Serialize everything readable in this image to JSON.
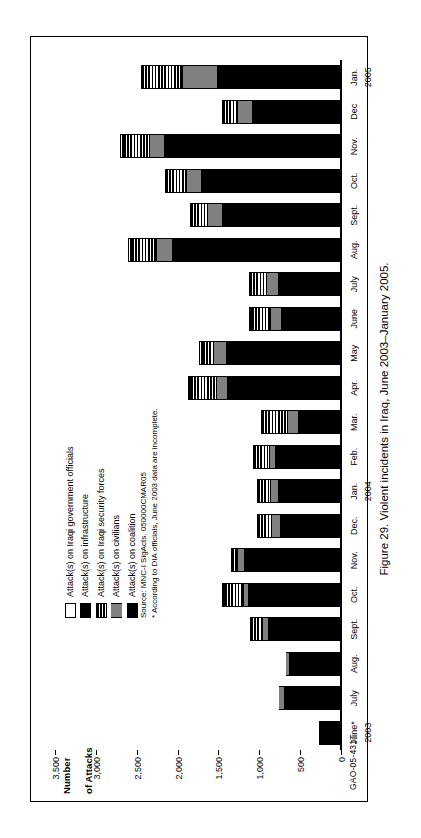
{
  "caption": "Figure 29. Violent incidents in Iraq, June 2003–January 2005.",
  "report_id": "GAO-05-431T",
  "axis": {
    "y_title_line1": "Number",
    "y_title_line2": "of Attacks"
  },
  "legend": {
    "items": [
      {
        "label": "Attack(s) on Iraqi government officials",
        "key": "gov",
        "swatch": "white-outline"
      },
      {
        "label": "Attack(s) on infrastructure",
        "key": "infra",
        "swatch": "black"
      },
      {
        "label": "Attack(s) on Iraqi security forces",
        "key": "security",
        "swatch": "horizontal-stripes"
      },
      {
        "label": "Attack(s) on civilians",
        "key": "civilians",
        "swatch": "gray"
      },
      {
        "label": "Attack(s) on coalition",
        "key": "coalition",
        "swatch": "black"
      }
    ]
  },
  "notes": [
    "Source: MNC-I SigActs. 050000CMAR05",
    "* According to DIA officials, June 2003 data are incomplete."
  ],
  "chart_data": {
    "type": "bar",
    "stacked": true,
    "title": "Figure 29. Violent incidents in Iraq, June 2003–January 2005.",
    "xlabel": "",
    "ylabel": "Number of Attacks",
    "ylim": [
      0,
      3500
    ],
    "ytick_labels": [
      "0",
      "500",
      "1,000",
      "1,500",
      "2,000",
      "2,500",
      "3,000",
      "3,500"
    ],
    "ytick_values": [
      0,
      500,
      1000,
      1500,
      2000,
      2500,
      3000,
      3500
    ],
    "grid": false,
    "legend_position": "inside-upper-left",
    "categories": [
      "June*",
      "July",
      "Aug.",
      "Sept.",
      "Oct.",
      "Nov.",
      "Dec.",
      "Jan.",
      "Feb.",
      "Mar.",
      "Apr.",
      "May",
      "June",
      "July",
      "Aug.",
      "Sept.",
      "Oct.",
      "Nov.",
      "Dec",
      "Jan."
    ],
    "category_years": [
      "2003",
      "",
      "",
      "",
      "",
      "",
      "",
      "2004",
      "",
      "",
      "",
      "",
      "",
      "",
      "",
      "",
      "",
      "",
      "",
      "2005"
    ],
    "series": [
      {
        "name": "Attack(s) on coalition",
        "key": "coalition",
        "color": "#000000",
        "values": [
          260,
          690,
          620,
          880,
          1120,
          1180,
          740,
          760,
          790,
          520,
          1380,
          1400,
          720,
          760,
          2060,
          1440,
          1700,
          2160,
          1080,
          1500
        ]
      },
      {
        "name": "Attack(s) on civilians",
        "key": "civilians",
        "color": "#808080",
        "values": [
          0,
          60,
          40,
          60,
          60,
          70,
          90,
          80,
          70,
          120,
          120,
          140,
          130,
          130,
          180,
          180,
          170,
          170,
          170,
          420
        ]
      },
      {
        "name": "Attack(s) on Iraqi security forces",
        "key": "security",
        "color": "#000000",
        "values": [
          0,
          0,
          0,
          160,
          240,
          80,
          190,
          180,
          200,
          330,
          330,
          150,
          240,
          230,
          320,
          220,
          270,
          320,
          200,
          510
        ]
      },
      {
        "name": "Attack(s) on infrastructure",
        "key": "infra",
        "color": "#000000",
        "values": [
          0,
          0,
          0,
          0,
          0,
          0,
          0,
          0,
          0,
          0,
          0,
          0,
          0,
          0,
          0,
          0,
          0,
          0,
          0,
          0
        ]
      },
      {
        "name": "Attack(s) on Iraqi government officials",
        "key": "gov",
        "color": "#ffffff",
        "values": [
          0,
          0,
          0,
          0,
          20,
          0,
          0,
          0,
          0,
          0,
          20,
          30,
          30,
          0,
          40,
          0,
          0,
          40,
          0,
          0
        ]
      }
    ],
    "totals": [
      260,
      750,
      660,
      1100,
      1440,
      1330,
      1020,
      1020,
      1060,
      970,
      1850,
      1720,
      1120,
      1120,
      2600,
      1840,
      2140,
      2690,
      1450,
      2430
    ]
  }
}
